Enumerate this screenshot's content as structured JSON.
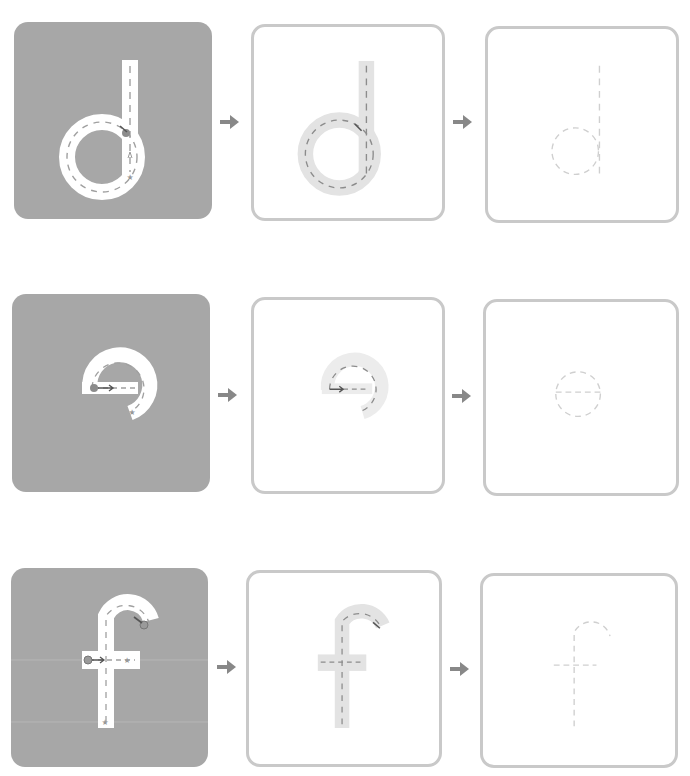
{
  "worksheet": {
    "rows": [
      {
        "letter": "d",
        "steps": [
          {
            "label": "Trace with guide (solid background)",
            "icon": "letter-d-guided-trace-icon"
          },
          {
            "label": "Trace shaded letter",
            "icon": "letter-d-shaded-trace-icon"
          },
          {
            "label": "Trace dashed outline",
            "icon": "letter-d-dashed-trace-icon"
          }
        ]
      },
      {
        "letter": "e",
        "steps": [
          {
            "label": "Trace with guide (solid background)",
            "icon": "letter-e-guided-trace-icon"
          },
          {
            "label": "Trace shaded letter",
            "icon": "letter-e-shaded-trace-icon"
          },
          {
            "label": "Trace dashed outline",
            "icon": "letter-e-dashed-trace-icon"
          }
        ]
      },
      {
        "letter": "f",
        "steps": [
          {
            "label": "Trace with guide (solid background)",
            "icon": "letter-f-guided-trace-icon"
          },
          {
            "label": "Trace shaded letter",
            "icon": "letter-f-shaded-trace-icon"
          },
          {
            "label": "Trace dashed outline",
            "icon": "letter-f-dashed-trace-icon"
          }
        ]
      }
    ],
    "arrow_icon": "right-arrow-icon",
    "colors": {
      "solid_card": "#a7a7a7",
      "outline_border": "#c9c9c9",
      "shaded_letter": "#e3e3e3",
      "dash": "#8c8c8c",
      "light_dash": "#cfcfcf",
      "arrow": "#888888"
    }
  }
}
